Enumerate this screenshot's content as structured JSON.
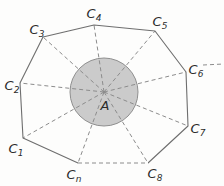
{
  "figure": {
    "width": 224,
    "height": 186,
    "background_color": "#fdfdfc",
    "center": {
      "label": "A",
      "label_x": 105,
      "label_y": 105,
      "x": 104,
      "y": 92,
      "circle_radius": 34,
      "circle_fill": "#c9c9c9",
      "circle_stroke": "#8a8a8a"
    },
    "style": {
      "polygon_stroke": "#6e6e6e",
      "polygon_stroke_width": 1.1,
      "spoke_stroke": "#8c8c8c",
      "spoke_stroke_width": 1,
      "spoke_dash": "4 3",
      "text_color": "#2b2b2b"
    },
    "vertices": [
      {
        "name": "c1",
        "label": "C",
        "sub": "1",
        "x": 23,
        "y": 138,
        "label_x": 16,
        "label_y": 148
      },
      {
        "name": "c2",
        "label": "C",
        "sub": "2",
        "x": 20,
        "y": 83,
        "label_x": 12,
        "label_y": 85
      },
      {
        "name": "c3",
        "label": "C",
        "sub": "3",
        "x": 43,
        "y": 37,
        "label_x": 37,
        "label_y": 29
      },
      {
        "name": "c4",
        "label": "C",
        "sub": "4",
        "x": 94,
        "y": 25,
        "label_x": 94,
        "label_y": 13
      },
      {
        "name": "c5",
        "label": "C",
        "sub": "5",
        "x": 155,
        "y": 31,
        "label_x": 160,
        "label_y": 21
      },
      {
        "name": "c6",
        "label": "C",
        "sub": "6",
        "x": 186,
        "y": 72,
        "label_x": 196,
        "label_y": 69
      },
      {
        "name": "c7",
        "label": "C",
        "sub": "7",
        "x": 188,
        "y": 126,
        "label_x": 198,
        "label_y": 128
      },
      {
        "name": "c8",
        "label": "C",
        "sub": "8",
        "x": 148,
        "y": 163,
        "label_x": 155,
        "label_y": 173
      },
      {
        "name": "cn",
        "label": "C",
        "sub": "n",
        "x": 78,
        "y": 163,
        "label_x": 74,
        "label_y": 174
      }
    ],
    "continuation_marker": {
      "name": "continuation-dashes",
      "x1": 203,
      "y1": 65,
      "x2": 224,
      "y2": 64,
      "dash": "4 3"
    }
  }
}
